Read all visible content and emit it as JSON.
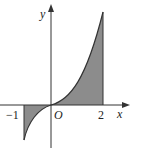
{
  "figure": {
    "axis_labels": {
      "x": "x",
      "y": "y"
    },
    "origin_label": "O",
    "tick_labels": {
      "left": "−1",
      "right": "2"
    },
    "shaded_region": {
      "from": "−1",
      "to": "2",
      "color": "#8c8c8c"
    },
    "curve_color": "#333333"
  }
}
